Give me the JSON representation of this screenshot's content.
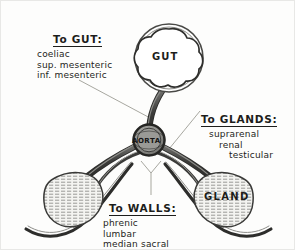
{
  "diagram": {
    "central_hub_label": "AORTA",
    "organs": [
      {
        "name": "gut-organ",
        "label": "GUT"
      },
      {
        "name": "gland-organ-right",
        "label": "GLAND"
      },
      {
        "name": "gland-organ-left",
        "label": ""
      }
    ],
    "callouts": {
      "gut": {
        "heading": "To GUT:",
        "items": [
          "coeliac",
          "sup. mesenteric",
          "inf. mesenteric"
        ]
      },
      "glands": {
        "heading": "To GLANDS:",
        "items": [
          "suprarenal",
          "renal",
          "testicular"
        ]
      },
      "walls": {
        "heading": "To WALLS:",
        "items": [
          "phrenic",
          "lumbar",
          "median sacral"
        ]
      }
    }
  },
  "colors": {
    "background": "#fdfdfc",
    "ink": "#1d1d1b",
    "vessel_dark": "#3a3a38",
    "vessel_mid": "#6f6f6c",
    "organ_fill": "#f2f2ef",
    "hatch": "#8a8a86",
    "leader": "#8f8f8b"
  }
}
